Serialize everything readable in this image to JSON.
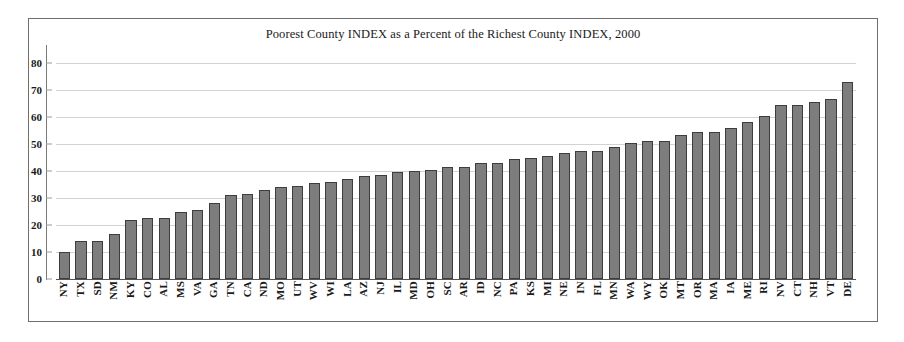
{
  "chart_data": {
    "type": "bar",
    "title": "Poorest County INDEX as a Percent of the Richest County INDEX, 2000",
    "xlabel": "",
    "ylabel": "",
    "ylim": [
      0,
      80
    ],
    "ytick_step": 10,
    "yticks": [
      80,
      70,
      60,
      50,
      40,
      30,
      20,
      10,
      0
    ],
    "grid": true,
    "legend": "none",
    "bar_color": "#7d7d7d",
    "bar_border_color": "#3d3d3d",
    "categories": [
      "NY",
      "TX",
      "SD",
      "NM",
      "KY",
      "CO",
      "AL",
      "MS",
      "VA",
      "GA",
      "TN",
      "CA",
      "ND",
      "MO",
      "UT",
      "WV",
      "WI",
      "LA",
      "AZ",
      "NJ",
      "IL",
      "MD",
      "OH",
      "SC",
      "AR",
      "ID",
      "NC",
      "PA",
      "KS",
      "MI",
      "NE",
      "IN",
      "FL",
      "MN",
      "WA",
      "WY",
      "OK",
      "MT",
      "OR",
      "MA",
      "IA",
      "ME",
      "RI",
      "NV",
      "CT",
      "NH",
      "VT",
      "DE"
    ],
    "values": [
      10,
      14,
      14,
      16.5,
      22,
      22.5,
      22.5,
      25,
      25.5,
      28,
      31,
      31.5,
      33,
      34,
      34.5,
      35.5,
      36,
      37,
      38,
      38.5,
      39.5,
      40,
      40.5,
      41.5,
      41.5,
      43,
      43,
      44.5,
      45,
      45.5,
      46.5,
      47.5,
      47.5,
      49,
      50.5,
      51,
      51,
      53.5,
      54.5,
      54.5,
      56,
      58,
      60.5,
      64.5,
      64.5,
      65.5,
      66.5,
      73
    ]
  }
}
